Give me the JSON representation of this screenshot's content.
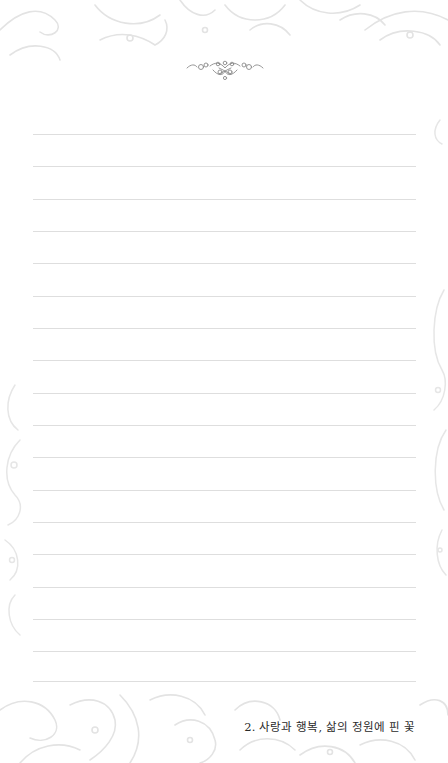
{
  "page": {
    "type": "lined-notebook-page",
    "background_color": "#ffffff",
    "line_color": "#dedede",
    "ornament_color": "#8a8a8a",
    "floral_color": "#e6e6e6"
  },
  "header": {
    "ornament_icon": "flourish-divider-icon"
  },
  "lines": {
    "count": 18,
    "top": 134,
    "spacing": 32.35
  },
  "footer": {
    "title": "2. 사랑과 행복, 삶의 정원에 핀 꽃"
  }
}
